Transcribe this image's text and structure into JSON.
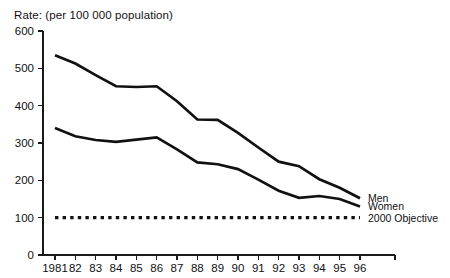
{
  "chart_data": {
    "type": "line",
    "title": "Rate: (per 100 000 population)",
    "xlabel": "",
    "ylabel": "",
    "ylim": [
      0,
      600
    ],
    "ytick_values": [
      0,
      100,
      200,
      300,
      400,
      500,
      600
    ],
    "ytick_labels": [
      "0",
      "100",
      "200",
      "300",
      "400",
      "500",
      "600"
    ],
    "grid": false,
    "legend_position": "right-inline",
    "categories": [
      "1981",
      "82",
      "83",
      "84",
      "85",
      "86",
      "87",
      "88",
      "89",
      "90",
      "91",
      "92",
      "93",
      "94",
      "95",
      "96"
    ],
    "series": [
      {
        "name": "Men",
        "style": "solid",
        "color": "#111111",
        "values": [
          535,
          513,
          482,
          452,
          450,
          452,
          412,
          363,
          362,
          327,
          288,
          250,
          238,
          203,
          180,
          152
        ]
      },
      {
        "name": "Women",
        "style": "solid",
        "color": "#111111",
        "values": [
          340,
          318,
          308,
          303,
          309,
          315,
          283,
          248,
          243,
          230,
          202,
          172,
          153,
          158,
          150,
          130
        ]
      },
      {
        "name": "2000 Objective",
        "style": "dotted",
        "color": "#111111",
        "values": [
          100,
          100,
          100,
          100,
          100,
          100,
          100,
          100,
          100,
          100,
          100,
          100,
          100,
          100,
          100,
          100
        ]
      }
    ],
    "legend": [
      "Men",
      "Women",
      "2000 Objective"
    ]
  }
}
